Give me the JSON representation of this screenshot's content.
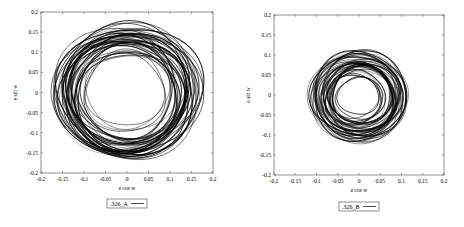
{
  "chart_data": [
    {
      "type": "scatter",
      "title": "",
      "xlabel": "e cos w",
      "ylabel": "e sin w",
      "xlim": [
        -0.2,
        0.2
      ],
      "ylim": [
        -0.2,
        0.2
      ],
      "xticks": [
        "-0.2",
        "-0.15",
        "-0.1",
        "-0.05",
        "0",
        "0.05",
        "0.1",
        "0.15",
        "0.2"
      ],
      "yticks": [
        "0.2",
        "0.15",
        "0.1",
        "0.05",
        "0",
        "-0.05",
        "-0.1",
        "-0.15",
        "-0.2"
      ],
      "grid": false,
      "legend": {
        "position": "below",
        "entries": [
          ".326_A"
        ]
      },
      "series": [
        {
          "name": ".326_A",
          "description": "dense annular trajectory around origin",
          "outer_radius": 0.17,
          "inner_radius": 0.08,
          "center": [
            0.0,
            0.0
          ]
        }
      ]
    },
    {
      "type": "scatter",
      "title": "",
      "xlabel": "e cos w",
      "ylabel": "e sin w",
      "xlim": [
        -0.2,
        0.2
      ],
      "ylim": [
        -0.2,
        0.2
      ],
      "xticks": [
        "-0.2",
        "-0.15",
        "-0.1",
        "-0.05",
        "0",
        "0.05",
        "0.1",
        "0.15",
        "0.2"
      ],
      "yticks": [
        "0.2",
        "0.15",
        "0.1",
        "0.05",
        "0",
        "-0.05",
        "-0.1",
        "-0.15",
        "-0.2"
      ],
      "grid": false,
      "legend": {
        "position": "below",
        "entries": [
          ".326_B"
        ]
      },
      "series": [
        {
          "name": ".326_B",
          "description": "dense annular trajectory around origin",
          "outer_radius": 0.115,
          "inner_radius": 0.035,
          "center": [
            0.0,
            -0.005
          ]
        }
      ]
    }
  ],
  "plots": [
    {
      "xlabel": "e cos w",
      "ylabel": "e sin w",
      "legend": ".326_A"
    },
    {
      "xlabel": "e cos w",
      "ylabel": "e sin w",
      "legend": ".326_B"
    }
  ],
  "colors": {
    "line": "#000000",
    "axis": "#444444",
    "background": "#ffffff"
  }
}
